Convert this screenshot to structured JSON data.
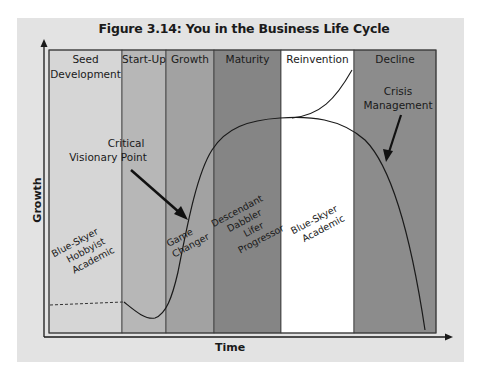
{
  "figure": {
    "title": "Figure 3.14: You in the Business Life Cycle",
    "x_axis_label": "Time",
    "y_axis_label": "Growth"
  },
  "stages": [
    {
      "label_lines": [
        "Seed",
        "Development"
      ],
      "color": "#d6d6d6",
      "x0": 49,
      "x1": 122
    },
    {
      "label_lines": [
        "Start-Up"
      ],
      "color": "#b7b7b7",
      "x0": 122,
      "x1": 166
    },
    {
      "label_lines": [
        "Growth"
      ],
      "color": "#a2a2a2",
      "x0": 166,
      "x1": 214
    },
    {
      "label_lines": [
        "Maturity"
      ],
      "color": "#858585",
      "x0": 214,
      "x1": 281
    },
    {
      "label_lines": [
        "Reinvention"
      ],
      "color": "#ffffff",
      "x0": 281,
      "x1": 354
    },
    {
      "label_lines": [
        "Decline"
      ],
      "color": "#8c8c8c",
      "x0": 354,
      "x1": 436
    }
  ],
  "annotations": [
    {
      "name": "critical-visionary-point",
      "lines": [
        "Critical",
        "Visionary Point"
      ]
    },
    {
      "name": "crisis-management",
      "lines": [
        "Crisis",
        "Management"
      ]
    }
  ],
  "persona_labels": [
    {
      "name": "seed-personas",
      "lines": [
        "Blue-Skyer",
        "Hobbyist",
        "Academic"
      ]
    },
    {
      "name": "growth-personas",
      "lines": [
        "Game",
        "Changer"
      ]
    },
    {
      "name": "maturity-personas",
      "lines": [
        "Descendant",
        "Dabbler",
        "Lifer",
        "Progressor"
      ]
    },
    {
      "name": "reinvention-personas",
      "lines": [
        "Blue-Skyer",
        "Academic"
      ]
    }
  ]
}
